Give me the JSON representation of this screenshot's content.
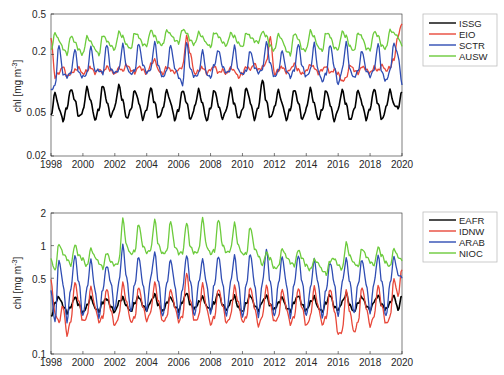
{
  "chart_data": [
    {
      "type": "line",
      "panel": "top",
      "title": "",
      "xlabel": "",
      "ylabel": "chl [mg m^-3]",
      "yscale": "log",
      "xlim": [
        1998,
        2020
      ],
      "ylim": [
        0.02,
        0.5
      ],
      "xticks": [
        "1998",
        "2000",
        "2002",
        "2004",
        "2006",
        "2008",
        "2010",
        "2012",
        "2014",
        "2016",
        "2018",
        "2020"
      ],
      "yticks": [
        "0.02",
        "0.05",
        "0.2",
        "0.5"
      ],
      "grid": false,
      "legend_position": "outside-right-top",
      "x": [
        1998.0,
        1998.25,
        1998.5,
        1998.75,
        1999.0,
        1999.25,
        1999.5,
        1999.75,
        2000.0,
        2000.25,
        2000.5,
        2000.75,
        2001.0,
        2001.25,
        2001.5,
        2001.75,
        2002.0,
        2002.25,
        2002.5,
        2002.75,
        2003.0,
        2003.25,
        2003.5,
        2003.75,
        2004.0,
        2004.25,
        2004.5,
        2004.75,
        2005.0,
        2005.25,
        2005.5,
        2005.75,
        2006.0,
        2006.25,
        2006.5,
        2006.75,
        2007.0,
        2007.25,
        2007.5,
        2007.75,
        2008.0,
        2008.25,
        2008.5,
        2008.75,
        2009.0,
        2009.25,
        2009.5,
        2009.75,
        2010.0,
        2010.25,
        2010.5,
        2010.75,
        2011.0,
        2011.25,
        2011.5,
        2011.75,
        2012.0,
        2012.25,
        2012.5,
        2012.75,
        2013.0,
        2013.25,
        2013.5,
        2013.75,
        2014.0,
        2014.25,
        2014.5,
        2014.75,
        2015.0,
        2015.25,
        2015.5,
        2015.75,
        2016.0,
        2016.25,
        2016.5,
        2016.75,
        2017.0,
        2017.25,
        2017.5,
        2017.75,
        2018.0,
        2018.25,
        2018.5,
        2018.75,
        2019.0,
        2019.25,
        2019.5,
        2019.75,
        2020.0
      ],
      "series": [
        {
          "name": "ISSG",
          "color": "#000000",
          "values": [
            0.05,
            0.085,
            0.06,
            0.045,
            0.06,
            0.09,
            0.07,
            0.048,
            0.055,
            0.095,
            0.07,
            0.046,
            0.058,
            0.1,
            0.068,
            0.048,
            0.06,
            0.098,
            0.07,
            0.047,
            0.058,
            0.09,
            0.068,
            0.046,
            0.057,
            0.092,
            0.066,
            0.047,
            0.058,
            0.09,
            0.068,
            0.046,
            0.057,
            0.088,
            0.066,
            0.045,
            0.06,
            0.09,
            0.066,
            0.045,
            0.06,
            0.09,
            0.062,
            0.046,
            0.057,
            0.092,
            0.064,
            0.047,
            0.058,
            0.095,
            0.068,
            0.046,
            0.06,
            0.11,
            0.068,
            0.047,
            0.06,
            0.09,
            0.066,
            0.046,
            0.058,
            0.09,
            0.066,
            0.045,
            0.058,
            0.092,
            0.066,
            0.046,
            0.058,
            0.09,
            0.064,
            0.044,
            0.057,
            0.088,
            0.064,
            0.045,
            0.058,
            0.09,
            0.066,
            0.046,
            0.058,
            0.09,
            0.064,
            0.045,
            0.06,
            0.09,
            0.065,
            0.06,
            0.085
          ]
        },
        {
          "name": "EIO",
          "color": "#e8483a",
          "values": [
            0.3,
            0.12,
            0.13,
            0.15,
            0.12,
            0.13,
            0.14,
            0.15,
            0.13,
            0.14,
            0.15,
            0.13,
            0.14,
            0.13,
            0.15,
            0.14,
            0.13,
            0.15,
            0.14,
            0.16,
            0.14,
            0.13,
            0.15,
            0.14,
            0.13,
            0.16,
            0.18,
            0.14,
            0.13,
            0.15,
            0.14,
            0.13,
            0.14,
            0.15,
            0.3,
            0.2,
            0.13,
            0.14,
            0.15,
            0.13,
            0.14,
            0.15,
            0.13,
            0.14,
            0.13,
            0.15,
            0.14,
            0.12,
            0.13,
            0.15,
            0.14,
            0.16,
            0.14,
            0.15,
            0.17,
            0.3,
            0.13,
            0.14,
            0.15,
            0.13,
            0.14,
            0.16,
            0.14,
            0.13,
            0.14,
            0.16,
            0.15,
            0.13,
            0.14,
            0.15,
            0.13,
            0.14,
            0.13,
            0.11,
            0.12,
            0.16,
            0.14,
            0.13,
            0.15,
            0.14,
            0.13,
            0.15,
            0.14,
            0.16,
            0.14,
            0.15,
            0.18,
            0.3,
            0.4
          ]
        },
        {
          "name": "SCTR",
          "color": "#2f4db3",
          "values": [
            0.09,
            0.1,
            0.25,
            0.13,
            0.12,
            0.13,
            0.22,
            0.13,
            0.12,
            0.13,
            0.24,
            0.14,
            0.14,
            0.13,
            0.25,
            0.14,
            0.13,
            0.14,
            0.25,
            0.15,
            0.13,
            0.14,
            0.26,
            0.16,
            0.13,
            0.14,
            0.26,
            0.15,
            0.12,
            0.14,
            0.25,
            0.15,
            0.12,
            0.1,
            0.26,
            0.14,
            0.12,
            0.13,
            0.22,
            0.13,
            0.12,
            0.16,
            0.22,
            0.15,
            0.13,
            0.14,
            0.24,
            0.14,
            0.13,
            0.14,
            0.22,
            0.15,
            0.13,
            0.14,
            0.26,
            0.16,
            0.12,
            0.14,
            0.22,
            0.14,
            0.12,
            0.14,
            0.25,
            0.15,
            0.12,
            0.14,
            0.26,
            0.14,
            0.11,
            0.13,
            0.25,
            0.15,
            0.1,
            0.14,
            0.26,
            0.14,
            0.12,
            0.14,
            0.22,
            0.14,
            0.12,
            0.14,
            0.25,
            0.13,
            0.11,
            0.14,
            0.26,
            0.2,
            0.1
          ]
        },
        {
          "name": "AUSW",
          "color": "#6ccb3c",
          "values": [
            0.22,
            0.33,
            0.28,
            0.23,
            0.2,
            0.3,
            0.26,
            0.22,
            0.2,
            0.3,
            0.27,
            0.23,
            0.2,
            0.31,
            0.27,
            0.24,
            0.22,
            0.33,
            0.3,
            0.25,
            0.23,
            0.33,
            0.3,
            0.25,
            0.24,
            0.34,
            0.3,
            0.26,
            0.25,
            0.35,
            0.32,
            0.28,
            0.26,
            0.35,
            0.32,
            0.27,
            0.25,
            0.33,
            0.3,
            0.26,
            0.24,
            0.33,
            0.3,
            0.26,
            0.24,
            0.32,
            0.3,
            0.26,
            0.24,
            0.33,
            0.3,
            0.27,
            0.26,
            0.33,
            0.3,
            0.24,
            0.22,
            0.32,
            0.28,
            0.22,
            0.2,
            0.32,
            0.28,
            0.22,
            0.22,
            0.34,
            0.3,
            0.24,
            0.22,
            0.33,
            0.3,
            0.23,
            0.22,
            0.33,
            0.3,
            0.24,
            0.22,
            0.33,
            0.3,
            0.23,
            0.22,
            0.33,
            0.3,
            0.24,
            0.23,
            0.35,
            0.33,
            0.3,
            0.24
          ]
        }
      ]
    },
    {
      "type": "line",
      "panel": "bottom",
      "title": "",
      "xlabel": "",
      "ylabel": "chl [mg m^-3]",
      "yscale": "log",
      "xlim": [
        1998,
        2020
      ],
      "ylim": [
        0.1,
        2
      ],
      "xticks": [
        "1998",
        "2000",
        "2002",
        "2004",
        "2006",
        "2008",
        "2010",
        "2012",
        "2014",
        "2016",
        "2018",
        "2020"
      ],
      "yticks": [
        "0.1",
        "0.5",
        "1",
        "2"
      ],
      "grid": false,
      "legend_position": "outside-right-top",
      "x": [
        1998.0,
        1998.25,
        1998.5,
        1998.75,
        1999.0,
        1999.25,
        1999.5,
        1999.75,
        2000.0,
        2000.25,
        2000.5,
        2000.75,
        2001.0,
        2001.25,
        2001.5,
        2001.75,
        2002.0,
        2002.25,
        2002.5,
        2002.75,
        2003.0,
        2003.25,
        2003.5,
        2003.75,
        2004.0,
        2004.25,
        2004.5,
        2004.75,
        2005.0,
        2005.25,
        2005.5,
        2005.75,
        2006.0,
        2006.25,
        2006.5,
        2006.75,
        2007.0,
        2007.25,
        2007.5,
        2007.75,
        2008.0,
        2008.25,
        2008.5,
        2008.75,
        2009.0,
        2009.25,
        2009.5,
        2009.75,
        2010.0,
        2010.25,
        2010.5,
        2010.75,
        2011.0,
        2011.25,
        2011.5,
        2011.75,
        2012.0,
        2012.25,
        2012.5,
        2012.75,
        2013.0,
        2013.25,
        2013.5,
        2013.75,
        2014.0,
        2014.25,
        2014.5,
        2014.75,
        2015.0,
        2015.25,
        2015.5,
        2015.75,
        2016.0,
        2016.25,
        2016.5,
        2016.75,
        2017.0,
        2017.25,
        2017.5,
        2017.75,
        2018.0,
        2018.25,
        2018.5,
        2018.75,
        2019.0,
        2019.25,
        2019.5,
        2019.75,
        2020.0
      ],
      "series": [
        {
          "name": "EAFR",
          "color": "#000000",
          "values": [
            0.22,
            0.3,
            0.34,
            0.28,
            0.24,
            0.27,
            0.33,
            0.28,
            0.24,
            0.28,
            0.34,
            0.27,
            0.25,
            0.3,
            0.32,
            0.27,
            0.24,
            0.3,
            0.33,
            0.28,
            0.25,
            0.3,
            0.34,
            0.28,
            0.25,
            0.3,
            0.35,
            0.28,
            0.25,
            0.3,
            0.34,
            0.28,
            0.25,
            0.3,
            0.36,
            0.28,
            0.26,
            0.3,
            0.34,
            0.28,
            0.26,
            0.3,
            0.36,
            0.28,
            0.25,
            0.3,
            0.34,
            0.27,
            0.25,
            0.3,
            0.35,
            0.28,
            0.25,
            0.3,
            0.34,
            0.28,
            0.26,
            0.3,
            0.34,
            0.27,
            0.25,
            0.3,
            0.34,
            0.28,
            0.25,
            0.3,
            0.34,
            0.27,
            0.25,
            0.3,
            0.35,
            0.27,
            0.25,
            0.3,
            0.36,
            0.28,
            0.25,
            0.3,
            0.34,
            0.28,
            0.25,
            0.3,
            0.34,
            0.28,
            0.26,
            0.3,
            0.35,
            0.26,
            0.34
          ]
        },
        {
          "name": "IDNW",
          "color": "#e8483a",
          "values": [
            0.48,
            0.24,
            0.2,
            0.28,
            0.15,
            0.2,
            0.45,
            0.3,
            0.2,
            0.22,
            0.42,
            0.28,
            0.2,
            0.22,
            0.4,
            0.25,
            0.18,
            0.22,
            0.45,
            0.3,
            0.2,
            0.22,
            0.42,
            0.28,
            0.2,
            0.24,
            0.45,
            0.3,
            0.2,
            0.22,
            0.4,
            0.28,
            0.2,
            0.22,
            0.55,
            0.3,
            0.2,
            0.22,
            0.45,
            0.27,
            0.19,
            0.22,
            0.4,
            0.28,
            0.19,
            0.22,
            0.42,
            0.3,
            0.2,
            0.22,
            0.42,
            0.27,
            0.18,
            0.22,
            0.42,
            0.28,
            0.2,
            0.22,
            0.4,
            0.27,
            0.19,
            0.22,
            0.4,
            0.26,
            0.18,
            0.22,
            0.42,
            0.28,
            0.19,
            0.22,
            0.4,
            0.25,
            0.15,
            0.16,
            0.38,
            0.24,
            0.16,
            0.2,
            0.42,
            0.27,
            0.18,
            0.22,
            0.42,
            0.27,
            0.19,
            0.22,
            0.5,
            0.35,
            0.6
          ]
        },
        {
          "name": "ARAB",
          "color": "#2f4db3",
          "values": [
            0.38,
            0.2,
            0.75,
            0.45,
            0.2,
            0.4,
            0.8,
            0.45,
            0.22,
            0.4,
            0.75,
            0.4,
            0.22,
            0.4,
            0.65,
            0.45,
            0.25,
            0.45,
            1.0,
            0.5,
            0.25,
            0.45,
            0.8,
            0.45,
            0.25,
            0.5,
            0.85,
            0.45,
            0.22,
            0.45,
            0.75,
            0.45,
            0.22,
            0.4,
            0.8,
            0.45,
            0.22,
            0.45,
            0.75,
            0.45,
            0.24,
            0.45,
            0.8,
            0.45,
            0.22,
            0.45,
            0.8,
            0.45,
            0.22,
            0.45,
            0.85,
            0.45,
            0.22,
            0.45,
            0.9,
            0.45,
            0.22,
            0.45,
            0.8,
            0.45,
            0.22,
            0.45,
            0.8,
            0.45,
            0.22,
            0.4,
            0.75,
            0.45,
            0.22,
            0.4,
            0.7,
            0.45,
            0.22,
            0.45,
            0.75,
            0.45,
            0.24,
            0.45,
            0.75,
            0.45,
            0.24,
            0.45,
            0.8,
            0.45,
            0.22,
            0.45,
            0.8,
            0.55,
            0.5
          ]
        },
        {
          "name": "NIOC",
          "color": "#6ccb3c",
          "values": [
            0.75,
            0.6,
            1.05,
            0.85,
            0.75,
            0.65,
            1.0,
            0.8,
            0.75,
            0.65,
            0.95,
            0.8,
            0.7,
            0.62,
            0.85,
            0.7,
            0.65,
            0.7,
            1.75,
            1.0,
            0.85,
            0.9,
            1.6,
            1.0,
            0.85,
            0.9,
            1.7,
            1.0,
            0.85,
            0.9,
            1.7,
            1.0,
            0.85,
            0.85,
            1.6,
            0.95,
            0.85,
            0.9,
            1.8,
            1.0,
            0.85,
            0.9,
            1.75,
            1.0,
            0.85,
            0.9,
            1.6,
            1.0,
            0.85,
            0.85,
            1.5,
            0.95,
            0.8,
            0.65,
            0.85,
            0.75,
            0.62,
            0.65,
            0.95,
            0.8,
            0.7,
            0.65,
            0.9,
            0.75,
            0.65,
            0.6,
            0.75,
            0.7,
            0.6,
            0.55,
            0.72,
            0.75,
            0.65,
            0.6,
            1.05,
            0.8,
            0.7,
            0.65,
            0.95,
            0.8,
            0.7,
            0.65,
            0.95,
            0.8,
            0.7,
            0.65,
            0.95,
            0.8,
            0.72
          ]
        }
      ]
    }
  ],
  "panels": {
    "top": {
      "ylabel": "chl [mg m",
      "ylabel_sup": "-3",
      "ylabel_end": "]",
      "ytick_labels": [
        "0.5",
        "0.2",
        "0.05",
        "0.02"
      ],
      "xtick_labels": [
        "1998",
        "2000",
        "2002",
        "2004",
        "2006",
        "2008",
        "2010",
        "2012",
        "2014",
        "2016",
        "2018",
        "2020"
      ],
      "legend": [
        "ISSG",
        "EIO",
        "SCTR",
        "AUSW"
      ]
    },
    "bottom": {
      "ylabel": "chl [mg m",
      "ylabel_sup": "-3",
      "ylabel_end": "]",
      "ytick_labels": [
        "2",
        "1",
        "0.5",
        "0.1"
      ],
      "xtick_labels": [
        "1998",
        "2000",
        "2002",
        "2004",
        "2006",
        "2008",
        "2010",
        "2012",
        "2014",
        "2016",
        "2018",
        "2020"
      ],
      "legend": [
        "EAFR",
        "IDNW",
        "ARAB",
        "NIOC"
      ]
    }
  }
}
